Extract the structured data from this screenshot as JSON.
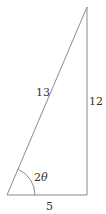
{
  "diagram": {
    "type": "right-triangle",
    "stroke_color": "#8a8a8a",
    "label_color": "#333333",
    "hypotenuse_label": "13",
    "vertical_leg_label": "12",
    "base_label": "5",
    "angle_label_number": "2",
    "angle_label_symbol": "θ",
    "vertices": {
      "bottom_left": [
        7,
        195
      ],
      "bottom_right": [
        87,
        195
      ],
      "top": [
        87,
        7
      ]
    }
  }
}
